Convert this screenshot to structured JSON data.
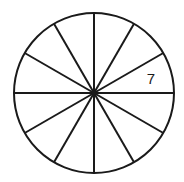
{
  "diagram": {
    "type": "divided-circle",
    "sectors": 12,
    "center": [
      94,
      93
    ],
    "radius": 80,
    "stroke_color": "#1a1a1a",
    "background": "#ffffff",
    "labels": [
      {
        "text": "7",
        "sector_position": "between 15° and 45° above horizontal, right side",
        "x": 151,
        "y": 84
      }
    ]
  }
}
